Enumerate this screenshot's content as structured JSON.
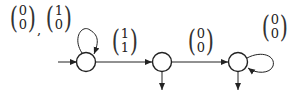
{
  "diagram": {
    "type": "finite-automaton",
    "states": [
      {
        "id": "q0",
        "initial": true,
        "has_output_arrow": false
      },
      {
        "id": "q1",
        "initial": false,
        "has_output_arrow": true
      },
      {
        "id": "q2",
        "initial": false,
        "has_output_arrow": true
      }
    ],
    "self_loop_q0": {
      "labels": [
        {
          "top": "0",
          "bottom": "0"
        },
        {
          "top": "1",
          "bottom": "0"
        }
      ],
      "separator": ","
    },
    "transition_q0_q1": {
      "top": "1",
      "bottom": "1"
    },
    "transition_q1_q2": {
      "top": "0",
      "bottom": "0"
    },
    "self_loop_q2": {
      "top": "0",
      "bottom": "0"
    },
    "colors": {
      "stroke": "#222222",
      "background": "#ffffff"
    }
  }
}
